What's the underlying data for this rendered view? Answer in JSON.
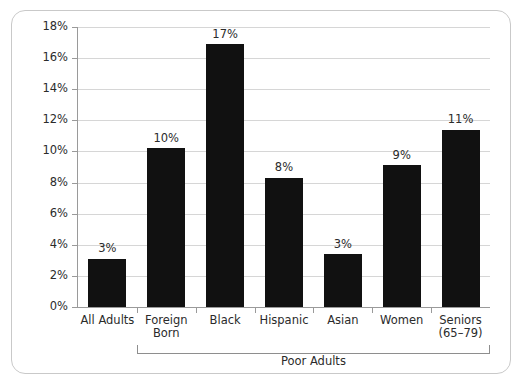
{
  "chart_data": {
    "type": "bar",
    "title": "",
    "subtitle": "",
    "xlabel": "",
    "ylabel": "",
    "categories": [
      "All Adults",
      "Foreign Born",
      "Black",
      "Hispanic",
      "Asian",
      "Women",
      "Seniors (65-79)"
    ],
    "category_lines": [
      [
        "All Adults"
      ],
      [
        "Foreign",
        "Born"
      ],
      [
        "Black"
      ],
      [
        "Hispanic"
      ],
      [
        "Asian"
      ],
      [
        "Women"
      ],
      [
        "Seniors",
        "(65–79)"
      ]
    ],
    "values": [
      3.1,
      10.2,
      16.9,
      8.3,
      3.4,
      9.1,
      11.4
    ],
    "data_labels": [
      "3%",
      "10%",
      "17%",
      "8%",
      "3%",
      "9%",
      "11%"
    ],
    "ylim": [
      0,
      18
    ],
    "ytick_values": [
      0,
      2,
      4,
      6,
      8,
      10,
      12,
      14,
      16,
      18
    ],
    "ytick_labels": [
      "0%",
      "2%",
      "4%",
      "6%",
      "8%",
      "10%",
      "12%",
      "14%",
      "16%",
      "18%"
    ],
    "grid": true,
    "legend": "none",
    "bar_color": "#111111",
    "grid_color": "#d6d6d6",
    "axis_color": "#9a9a9a",
    "groups": [
      {
        "label": "Poor Adults",
        "members": [
          "Foreign Born",
          "Black",
          "Hispanic",
          "Asian",
          "Women",
          "Seniors (65–79)"
        ]
      }
    ]
  },
  "frame": {
    "border_color": "#c9c9c9",
    "background": "#ffffff"
  }
}
